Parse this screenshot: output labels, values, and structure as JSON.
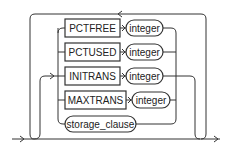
{
  "diagram": {
    "type": "railroad-syntax-diagram",
    "keywords": [
      {
        "label": "PCTFREE",
        "param": "integer"
      },
      {
        "label": "PCTUSED",
        "param": "integer"
      },
      {
        "label": "INITRANS",
        "param": "integer"
      },
      {
        "label": "MAXTRANS",
        "param": "integer"
      }
    ],
    "clause": {
      "label": "storage_clause"
    },
    "colors": {
      "line": "#333333",
      "text": "#222222",
      "background": "#ffffff"
    }
  }
}
